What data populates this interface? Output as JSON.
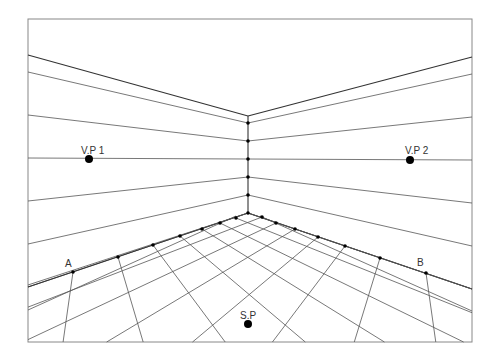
{
  "diagram": {
    "frame": {
      "x1": 28,
      "y1": 19,
      "x2": 472,
      "y2": 342
    },
    "horizon_y": 159,
    "labels": {
      "vp1": "V.P 1",
      "vp2": "V.P 2",
      "sp": "S.P",
      "a": "A",
      "b": "B"
    },
    "points": {
      "vp1": {
        "x": 89,
        "y": 159
      },
      "vp2": {
        "x": 410,
        "y": 160
      },
      "sp": {
        "x": 248,
        "y": 324
      },
      "corner_top": {
        "x": 248,
        "y": 116
      },
      "corner_floor": {
        "x": 248,
        "y": 213
      }
    },
    "wall_dots": [
      {
        "x": 248,
        "y": 123
      },
      {
        "x": 248,
        "y": 141
      },
      {
        "x": 248,
        "y": 159
      },
      {
        "x": 248,
        "y": 177
      },
      {
        "x": 248,
        "y": 195
      },
      {
        "x": 248,
        "y": 213
      }
    ],
    "floor_left_dots": [
      {
        "x": 73,
        "y": 272
      },
      {
        "x": 118,
        "y": 257
      },
      {
        "x": 153,
        "y": 245
      },
      {
        "x": 180,
        "y": 236
      },
      {
        "x": 202,
        "y": 229
      },
      {
        "x": 220,
        "y": 223
      },
      {
        "x": 236,
        "y": 218
      }
    ],
    "floor_right_dots": [
      {
        "x": 262,
        "y": 217
      },
      {
        "x": 276,
        "y": 223
      },
      {
        "x": 295,
        "y": 229
      },
      {
        "x": 318,
        "y": 237
      },
      {
        "x": 345,
        "y": 246
      },
      {
        "x": 380,
        "y": 258
      },
      {
        "x": 426,
        "y": 273
      }
    ],
    "left_wall_edge_y": [
      55,
      72,
      115,
      158,
      201,
      244,
      287
    ],
    "right_wall_edge_y": [
      57,
      74,
      117,
      160,
      203,
      246,
      289
    ],
    "wall_corner_y": [
      116,
      123,
      141,
      159,
      177,
      195,
      213
    ],
    "colors": {
      "line": "#555555",
      "heavy_line": "#333333",
      "dot": "#000000",
      "frame": "#888888",
      "background": "#ffffff"
    }
  }
}
